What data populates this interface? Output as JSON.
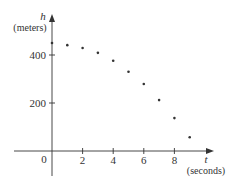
{
  "chart_data": {
    "type": "scatter",
    "title": "",
    "xlabel": "t",
    "xlabel_unit": "(seconds)",
    "ylabel": "h",
    "ylabel_unit": "(meters)",
    "x_ticks": [
      2,
      4,
      6,
      8
    ],
    "x_tick_labels": [
      "2",
      "4",
      "6",
      "8"
    ],
    "y_ticks": [
      200,
      400
    ],
    "y_tick_labels": [
      "200",
      "400"
    ],
    "origin_label": "0",
    "xlim": [
      -2.5,
      10.5
    ],
    "ylim": [
      -100,
      480
    ],
    "grid": false,
    "legend": null,
    "series": [
      {
        "name": "height",
        "x": [
          0,
          1,
          2,
          3,
          4,
          5,
          6,
          7,
          8,
          9
        ],
        "values": [
          450,
          441,
          429,
          409,
          376,
          330,
          279,
          212,
          137,
          57
        ]
      }
    ],
    "colors": {
      "axis": "#333333",
      "points": "#333333"
    }
  }
}
